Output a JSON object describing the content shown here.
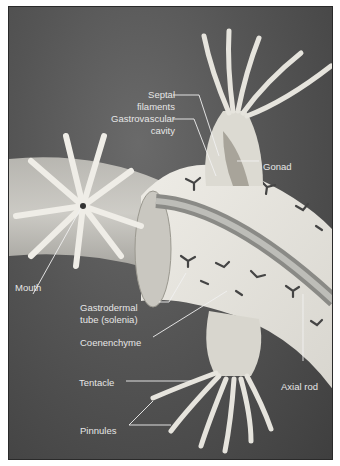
{
  "diagram": {
    "labels": {
      "septal_filaments_1": "Septal",
      "septal_filaments_2": "filaments",
      "gastrovascular_1": "Gastrovascular",
      "gastrovascular_2": "cavity",
      "gonad": "Gonad",
      "mouth": "Mouth",
      "gastrodermal_1": "Gastrodermal",
      "gastrodermal_2": "tube (solenia)",
      "coenenchyme": "Coenenchyme",
      "tentacle": "Tentacle",
      "axial_rod": "Axial rod",
      "pinnules": "Pinnules"
    },
    "colors": {
      "background": "#4f4f4f",
      "tissue": "#e8e6df",
      "label_text": "#e6e6e6",
      "leader_line": "#f0f0f0"
    }
  }
}
